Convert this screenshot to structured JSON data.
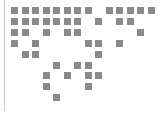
{
  "figure": {
    "square_color": "#8a8a8a",
    "border_color": "#c8c8c8",
    "origin": {
      "x": 11,
      "y": 7
    },
    "pitch": {
      "x": 10.5,
      "y": 10.9
    },
    "cell_size": 7,
    "rows": [
      [
        0,
        1,
        2,
        3,
        4,
        5,
        6,
        7,
        9,
        10,
        11,
        12,
        13
      ],
      [
        0,
        1,
        2,
        3,
        4,
        5,
        6,
        8,
        10,
        11
      ],
      [
        0,
        1,
        3,
        5,
        6,
        12
      ],
      [
        0,
        2,
        7,
        8,
        10
      ],
      [
        1,
        2,
        8
      ],
      [
        4,
        6,
        7
      ],
      [
        3,
        5,
        7,
        8
      ],
      [
        3,
        7
      ],
      [
        4
      ]
    ]
  }
}
